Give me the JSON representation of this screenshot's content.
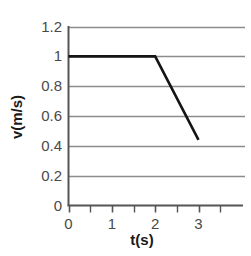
{
  "chart_data": {
    "type": "line",
    "title": "",
    "xlabel": "t(s)",
    "ylabel": "v(m/s)",
    "xlim": [
      0,
      3.5
    ],
    "ylim": [
      0,
      1.2
    ],
    "grid": true,
    "legend": false,
    "xticks": [
      0,
      1,
      2,
      3
    ],
    "xtick_labels": [
      "0",
      "1",
      "2",
      "3"
    ],
    "xminor_ticks": [
      0.5,
      1.5,
      2.5,
      3.5
    ],
    "yticks": [
      0,
      0.2,
      0.4,
      0.6,
      0.8,
      1,
      1.2
    ],
    "ytick_labels": [
      "0",
      "0.2",
      "0.4",
      "0.6",
      "0.8",
      "1",
      "1.2"
    ],
    "series": [
      {
        "name": "velocity",
        "color": "#141414",
        "x": [
          0,
          2,
          3
        ],
        "y": [
          1,
          1,
          0.44
        ]
      }
    ],
    "annotations": []
  },
  "style": {
    "line_color": "#141414",
    "grid_color": "#8c8c8c",
    "axis_color": "#555555",
    "tick_label_color": "#4a4a4a",
    "axis_title_color": "#1a1a1a",
    "background": "#ffffff"
  }
}
